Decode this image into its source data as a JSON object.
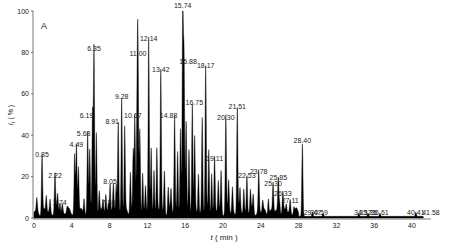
{
  "chart_data": {
    "type": "line",
    "title": "",
    "panel_label": "A",
    "xlabel": "t ( min )",
    "ylabel": "I r (%)",
    "xlim": [
      0,
      42
    ],
    "ylim": [
      0,
      100
    ],
    "x_ticks": [
      0,
      4,
      8,
      12,
      16,
      20,
      24,
      28,
      32,
      36,
      40
    ],
    "y_ticks": [
      0,
      20,
      40,
      60,
      80,
      100
    ],
    "grid": false,
    "legend": null,
    "peaks": [
      {
        "rt": "0.85",
        "x": 0.85,
        "y": 28
      },
      {
        "rt": "2.22",
        "x": 2.22,
        "y": 18
      },
      {
        "rt": "2.74",
        "x": 2.74,
        "y": 5
      },
      {
        "rt": "4.49",
        "x": 4.49,
        "y": 33
      },
      {
        "rt": "5.68",
        "x": 5.68,
        "y": 38
      },
      {
        "rt": "6.19",
        "x": 6.19,
        "y": 47
      },
      {
        "rt": "6.35",
        "x": 6.35,
        "y": 79
      },
      {
        "rt": "7.88",
        "x": 7.88,
        "y": 5
      },
      {
        "rt": "8.05",
        "x": 8.05,
        "y": 15
      },
      {
        "rt": "8.91",
        "x": 8.91,
        "y": 44
      },
      {
        "rt": "9.28",
        "x": 9.28,
        "y": 56
      },
      {
        "rt": "10.67",
        "x": 10.67,
        "y": 47
      },
      {
        "rt": "11.00",
        "x": 11.0,
        "y": 77
      },
      {
        "rt": "12.14",
        "x": 12.14,
        "y": 84
      },
      {
        "rt": "13.42",
        "x": 13.42,
        "y": 69
      },
      {
        "rt": "14.88",
        "x": 14.88,
        "y": 47
      },
      {
        "rt": "15.74",
        "x": 15.74,
        "y": 100
      },
      {
        "rt": "15.88",
        "x": 15.88,
        "y": 73
      },
      {
        "rt": "16.75",
        "x": 16.75,
        "y": 53
      },
      {
        "rt": "18.17",
        "x": 18.17,
        "y": 71
      },
      {
        "rt": "19.11",
        "x": 19.11,
        "y": 26
      },
      {
        "rt": "20.30",
        "x": 20.3,
        "y": 46
      },
      {
        "rt": "21.51",
        "x": 21.51,
        "y": 51
      },
      {
        "rt": "22.53",
        "x": 22.53,
        "y": 18
      },
      {
        "rt": "23.78",
        "x": 23.78,
        "y": 20
      },
      {
        "rt": "25.30",
        "x": 25.3,
        "y": 14
      },
      {
        "rt": "25.85",
        "x": 25.85,
        "y": 17
      },
      {
        "rt": "26.33",
        "x": 26.33,
        "y": 9
      },
      {
        "rt": "27.11",
        "x": 27.11,
        "y": 6
      },
      {
        "rt": "28.40",
        "x": 28.4,
        "y": 35
      },
      {
        "rt": "29.47",
        "x": 29.47,
        "y": 2
      },
      {
        "rt": "30.59",
        "x": 30.59,
        "y": 1.5
      },
      {
        "rt": "34.37",
        "x": 34.37,
        "y": 1.5
      },
      {
        "rt": "35.35",
        "x": 35.35,
        "y": 1.5
      },
      {
        "rt": "36.61",
        "x": 36.61,
        "y": 1.5
      },
      {
        "rt": "40.41",
        "x": 40.41,
        "y": 2
      },
      {
        "rt": "41.58",
        "x": 41.58,
        "y": 0.5
      }
    ]
  },
  "colors": {
    "trace": "#000000",
    "axis": "#555555",
    "text": "#222222"
  }
}
